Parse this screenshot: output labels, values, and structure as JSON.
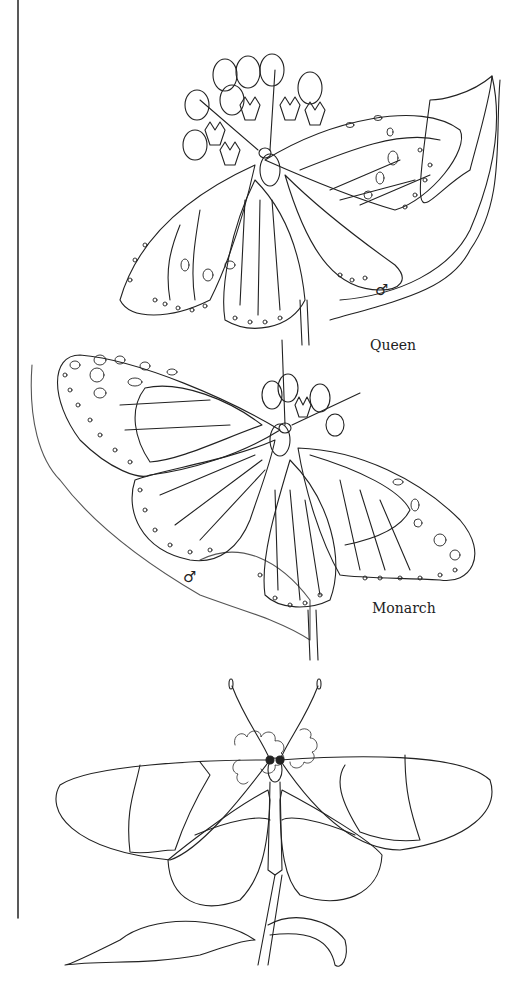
{
  "page": {
    "background": "#ffffff",
    "line_color": "#222222"
  },
  "labels": {
    "queen": "Queen",
    "monarch": "Monarch"
  },
  "symbols": {
    "queen_sex": "♂",
    "monarch_sex": "♂"
  },
  "illustrations": [
    {
      "name": "Queen butterfly on milkweed",
      "sex": "male"
    },
    {
      "name": "Monarch butterfly on milkweed",
      "sex": "male"
    },
    {
      "name": "Clearwing butterfly on flower"
    }
  ]
}
